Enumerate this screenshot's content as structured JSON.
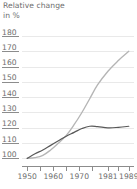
{
  "title": {
    "line1": "Relative change",
    "line2": "in %"
  },
  "axes": {
    "y": {
      "labels": [
        "180",
        "170",
        "160",
        "150",
        "140",
        "130",
        "120",
        "110",
        "100"
      ],
      "min": 95,
      "max": 182,
      "step": 10
    },
    "x": {
      "labels": [
        "1950",
        "1960",
        "1970",
        "1981",
        "1989"
      ],
      "label_years": [
        1950,
        1960,
        1970,
        1981,
        1989
      ],
      "tick_years": [
        1950,
        1955,
        1960,
        1965,
        1970,
        1975,
        1981,
        1985,
        1989
      ],
      "min": 1948,
      "max": 1991
    }
  },
  "colors": {
    "light_series": "#b5b5b5",
    "dark_series": "#595959",
    "gridline": "#e9e9e9",
    "axis": "#8c8c8c",
    "text": "#6d6d6d",
    "background": "#ffffff"
  },
  "chart_data": {
    "type": "line",
    "title": "Relative change in %",
    "xlabel": "",
    "ylabel": "Relative change in %",
    "xlim": [
      1948,
      1991
    ],
    "ylim": [
      95,
      182
    ],
    "grid": true,
    "legend": "none",
    "x_tick_labels": [
      "1950",
      "1960",
      "1970",
      "1981",
      "1989"
    ],
    "y_tick_labels": [
      "100",
      "110",
      "120",
      "130",
      "140",
      "150",
      "160",
      "170",
      "180"
    ],
    "series": [
      {
        "name": "light-series",
        "color": "#b5b5b5",
        "x": [
          1950,
          1953,
          1956,
          1959,
          1962,
          1965,
          1968,
          1971,
          1974,
          1977,
          1981,
          1985,
          1989
        ],
        "values": [
          100,
          100.5,
          102,
          105.5,
          110,
          115,
          122,
          130,
          139,
          148,
          157,
          164,
          170
        ]
      },
      {
        "name": "dark-series",
        "color": "#595959",
        "x": [
          1950,
          1953,
          1956,
          1959,
          1962,
          1965,
          1968,
          1971,
          1974,
          1977,
          1981,
          1985,
          1989
        ],
        "values": [
          100,
          103,
          105.5,
          108.5,
          111.5,
          114.5,
          117,
          119.5,
          121,
          120.8,
          120,
          120.3,
          121
        ]
      }
    ]
  }
}
